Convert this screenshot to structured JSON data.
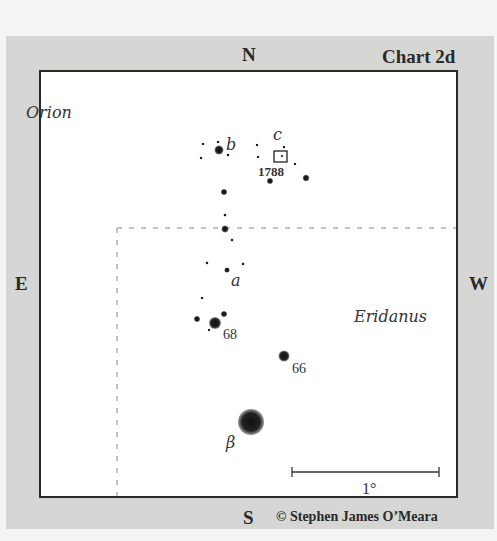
{
  "chart": {
    "title": "Chart 2d",
    "credit": "© Stephen James O’Meara"
  },
  "directions": {
    "north": "N",
    "south": "S",
    "east": "E",
    "west": "W"
  },
  "constellations": {
    "upper_left": "Orion",
    "lower_right": "Eridanus"
  },
  "star_labels": {
    "b": "b",
    "c": "c",
    "a": "a",
    "s68": "68",
    "s66": "66",
    "beta": "β"
  },
  "object_label": "1788",
  "scale_bar": {
    "label": "1°"
  },
  "colors": {
    "panel": "#d6d6d4",
    "chart_bg": "#ffffff",
    "ink": "#2a2a2a",
    "dashed_boundary": "#888888"
  }
}
